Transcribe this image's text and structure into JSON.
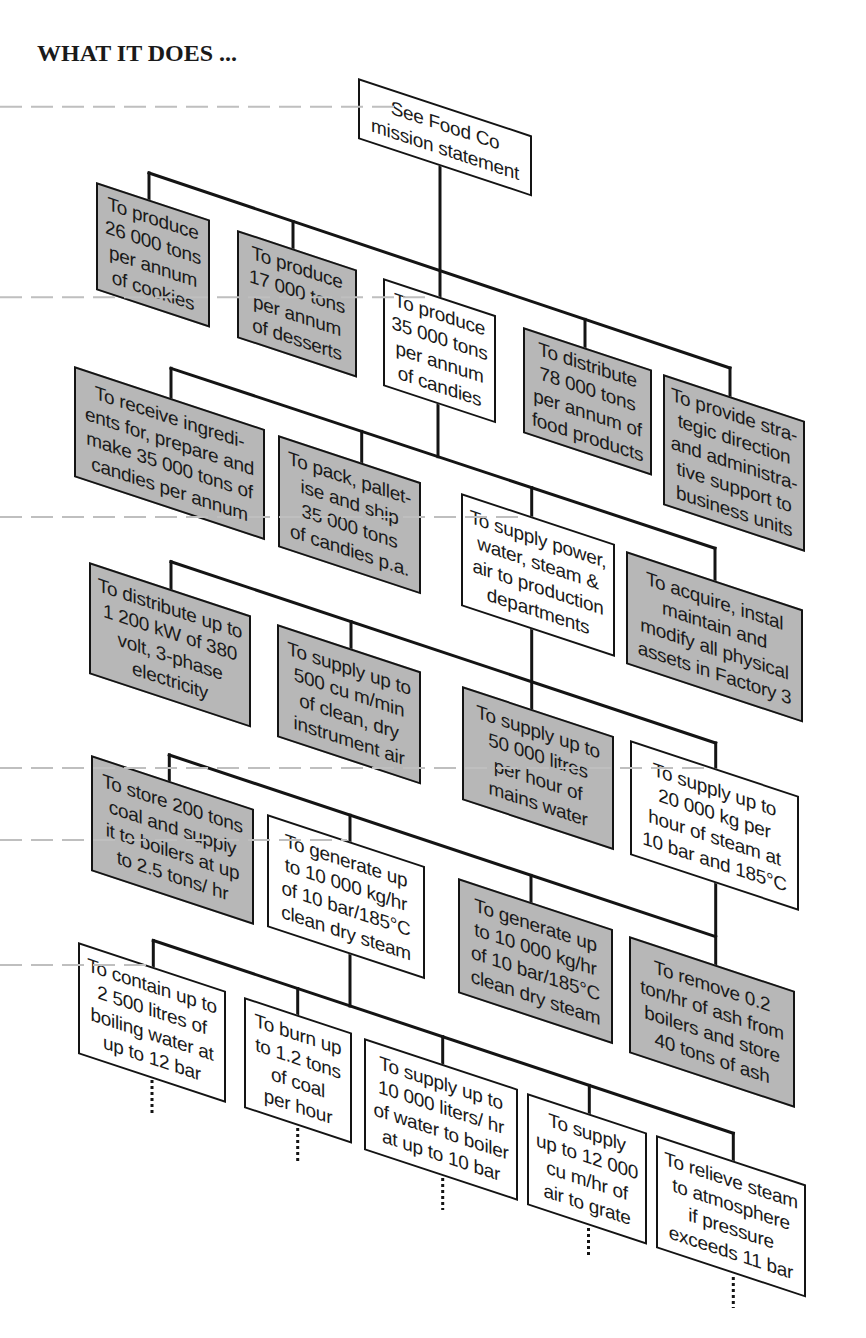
{
  "title": "WHAT IT DOES ...",
  "colors": {
    "box_fill_gray": "#b7b7b7",
    "box_fill_white": "#ffffff",
    "line": "#141414",
    "guide_dash": "#bfbfbf"
  },
  "nodes": {
    "mission": {
      "text": "See Food Co\nmission statement",
      "shade": "white",
      "parent": null
    },
    "cookies": {
      "text": "To produce\n26 000 tons\nper annum\nof cookies",
      "shade": "gray",
      "parent": "mission"
    },
    "desserts": {
      "text": "To produce\n17 000 tons\nper annum\nof desserts",
      "shade": "gray",
      "parent": "mission"
    },
    "candies": {
      "text": "To produce\n35 000 tons\nper annum\nof candies",
      "shade": "white",
      "parent": "mission"
    },
    "distribute_food": {
      "text": "To distribute\n78 000 tons\nper annum of\nfood products",
      "shade": "gray",
      "parent": "mission"
    },
    "strategic": {
      "text": "To provide stra-\ntegic direction\nand administra-\ntive support to\nbusiness units",
      "shade": "gray",
      "parent": "mission"
    },
    "receive": {
      "text": "To receive ingredi-\nents for, prepare and\nmake 35 000 tons of\ncandies per annum",
      "shade": "gray",
      "parent": "candies"
    },
    "pack": {
      "text": "To pack, pallet-\nise and ship\n35 000 tons\nof candies p.a.",
      "shade": "gray",
      "parent": "candies"
    },
    "utilities": {
      "text": "To supply power,\nwater, steam &\nair to production\ndepartments",
      "shade": "white",
      "parent": "candies"
    },
    "acquire": {
      "text": "To acquire, instal\nmaintain and\nmodify all physical\nassets in Factory 3",
      "shade": "gray",
      "parent": "candies"
    },
    "electricity": {
      "text": "To distribute up to\n1 200 kW of 380\nvolt, 3-phase\nelectricity",
      "shade": "gray",
      "parent": "utilities"
    },
    "instrument_air": {
      "text": "To supply up to\n500 cu m/min\nof clean, dry\ninstrument air",
      "shade": "gray",
      "parent": "utilities"
    },
    "mains_water": {
      "text": "To supply up to\n50 000 litres\nper hour of\nmains water",
      "shade": "gray",
      "parent": "utilities"
    },
    "steam_supply": {
      "text": "To supply up to\n20 000 kg per\nhour of steam at\n10 bar and 185°C",
      "shade": "white",
      "parent": "utilities"
    },
    "coal_store": {
      "text": "To store 200 tons\ncoal and supply\nit to boilers at up\nto 2.5 tons/ hr",
      "shade": "gray",
      "parent": "steam_supply"
    },
    "boiler_1": {
      "text": "To generate up\nto 10 000 kg/hr\nof 10 bar/185°C\nclean dry steam",
      "shade": "white",
      "parent": "steam_supply"
    },
    "boiler_2": {
      "text": "To generate up\nto 10 000 kg/hr\nof 10 bar/185°C\nclean dry steam",
      "shade": "gray",
      "parent": "steam_supply"
    },
    "ash_removal": {
      "text": "To remove 0.2\nton/hr of ash from\nboilers and store\n40 tons of ash",
      "shade": "gray",
      "parent": "steam_supply"
    },
    "contain_water": {
      "text": "To contain up to\n2 500 litres of\nboiling water at\nup to 12 bar",
      "shade": "white",
      "parent": "boiler_1",
      "continues_below": true
    },
    "burn_coal": {
      "text": "To burn up\nto 1.2 tons\nof coal\nper hour",
      "shade": "white",
      "parent": "boiler_1",
      "continues_below": true
    },
    "feed_water": {
      "text": "To supply up to\n10 000 liters/ hr\nof water to boiler\nat up to 10 bar",
      "shade": "white",
      "parent": "boiler_1",
      "continues_below": true
    },
    "combustion_air": {
      "text": "To supply\nup to 12 000\ncu m/hr of\nair to grate",
      "shade": "white",
      "parent": "boiler_1",
      "continues_below": true
    },
    "relieve_steam": {
      "text": "To relieve steam\nto atmosphere\nif pressure\nexceeds 11 bar",
      "shade": "white",
      "parent": "boiler_1",
      "continues_below": true
    }
  }
}
